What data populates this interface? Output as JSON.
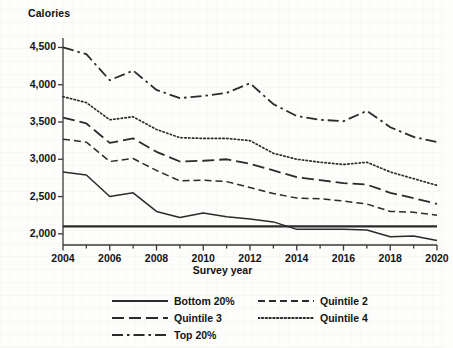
{
  "chart_data": {
    "type": "line",
    "title": "",
    "xlabel": "Survey year",
    "ylabel": "Calories",
    "x": [
      2004,
      2005,
      2006,
      2007,
      2008,
      2009,
      2010,
      2011,
      2012,
      2013,
      2014,
      2015,
      2016,
      2017,
      2018,
      2019,
      2020
    ],
    "xlim": [
      2004,
      2020
    ],
    "ylim": [
      1850,
      4600
    ],
    "ytick_labels": [
      "2,000",
      "2,500",
      "3,000",
      "3,500",
      "4,000",
      "4,500"
    ],
    "ytick_values": [
      2000,
      2500,
      3000,
      3500,
      4000,
      4500
    ],
    "xtick_labels": [
      "2004",
      "2006",
      "2008",
      "2010",
      "2012",
      "2014",
      "2016",
      "2018",
      "2020"
    ],
    "xtick_values": [
      2004,
      2006,
      2008,
      2010,
      2012,
      2014,
      2016,
      2018,
      2020
    ],
    "grid": false,
    "legend_position": "below",
    "reference_line": {
      "label": "",
      "value": 2100,
      "style": "solid"
    },
    "series": [
      {
        "name": "Bottom 20%",
        "style": "solid",
        "values": [
          2830,
          2790,
          2500,
          2550,
          2300,
          2220,
          2280,
          2230,
          2200,
          2160,
          2060,
          2060,
          2060,
          2050,
          1960,
          1970,
          1910
        ]
      },
      {
        "name": "Quintile 2",
        "style": "dashed",
        "values": [
          3270,
          3230,
          2970,
          3010,
          2850,
          2710,
          2720,
          2700,
          2620,
          2540,
          2480,
          2470,
          2440,
          2400,
          2300,
          2290,
          2250
        ]
      },
      {
        "name": "Quintile 3",
        "style": "longdash",
        "values": [
          3560,
          3480,
          3220,
          3280,
          3100,
          2970,
          2980,
          3000,
          2940,
          2850,
          2760,
          2720,
          2680,
          2660,
          2550,
          2480,
          2400
        ]
      },
      {
        "name": "Quintile 4",
        "style": "dotted",
        "values": [
          3840,
          3760,
          3530,
          3570,
          3400,
          3290,
          3280,
          3280,
          3250,
          3080,
          3000,
          2960,
          2930,
          2960,
          2830,
          2740,
          2650
        ]
      },
      {
        "name": "Top 20%",
        "style": "dashdot",
        "values": [
          4500,
          4410,
          4060,
          4190,
          3930,
          3820,
          3850,
          3890,
          4020,
          3740,
          3580,
          3530,
          3510,
          3650,
          3430,
          3300,
          3230
        ]
      }
    ]
  },
  "legend": {
    "entries": [
      {
        "label": "Bottom 20%",
        "style": "solid"
      },
      {
        "label": "Quintile 2",
        "style": "dashed"
      },
      {
        "label": "Quintile 3",
        "style": "longdash"
      },
      {
        "label": "Quintile 4",
        "style": "dotted"
      },
      {
        "label": "Top 20%",
        "style": "dashdot"
      }
    ]
  },
  "colors": {
    "line": "#2b2b2b",
    "axis": "#3a3a3a",
    "text": "#141414",
    "background": "#fdfdfb"
  }
}
